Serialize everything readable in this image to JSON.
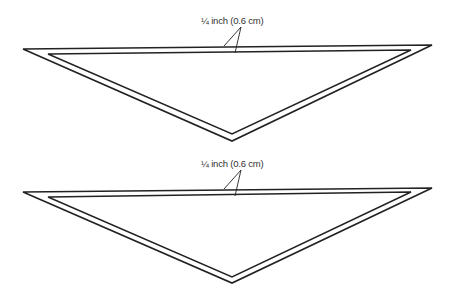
{
  "diagrams": [
    {
      "label": "¼ inch (0.6 cm)",
      "outer": [
        [
          23,
          49
        ],
        [
          432,
          45
        ],
        [
          232,
          141
        ]
      ],
      "inner": [
        [
          48,
          54
        ],
        [
          411,
          50
        ],
        [
          232,
          134
        ]
      ],
      "leaders": [
        [
          [
            241,
            27
          ],
          [
            224,
            46
          ]
        ],
        [
          [
            241,
            27
          ],
          [
            235,
            52
          ]
        ]
      ],
      "label_pos": [
        201,
        15
      ]
    },
    {
      "label": "¼ inch (0.6 cm)",
      "outer": [
        [
          23,
          192
        ],
        [
          432,
          188
        ],
        [
          232,
          283
        ]
      ],
      "inner": [
        [
          48,
          197
        ],
        [
          411,
          192
        ],
        [
          232,
          277
        ]
      ],
      "leaders": [
        [
          [
            241,
            170
          ],
          [
            224,
            189
          ]
        ],
        [
          [
            241,
            170
          ],
          [
            235,
            196
          ]
        ]
      ],
      "label_pos": [
        201,
        158
      ]
    }
  ],
  "colors": {
    "stroke": "#222222",
    "text": "#333333"
  }
}
